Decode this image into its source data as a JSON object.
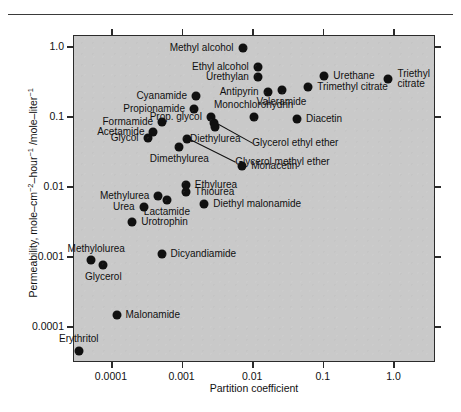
{
  "figure": {
    "x_axis_title": "Partition coefficient",
    "y_axis_title_parts": {
      "a": "Permeability, mole–cm",
      "sup1": "−2",
      "b": "–hour",
      "sup2": "−1",
      "c": " /mole–liter",
      "sup3": "−1"
    },
    "y_axis_title_plain": "Permeability, mole–cm⁻²–hour⁻¹ /mole–liter⁻¹",
    "plot_bg": "#c9c9c9",
    "frame_color": "#2b2b2b",
    "marker_color": "#101010"
  },
  "chart_data": {
    "type": "scatter",
    "title": "",
    "xlabel": "Partition coefficient",
    "ylabel": "Permeability, mole–cm⁻²–hour⁻¹ /mole–liter⁻¹",
    "xscale": "log",
    "yscale": "log",
    "xlim": [
      3e-05,
      4.0
    ],
    "ylim": [
      3e-05,
      1.4
    ],
    "xticks": [
      0.0001,
      0.001,
      0.01,
      0.1,
      1.0
    ],
    "xticklabels": [
      "0.0001",
      "0.001",
      "0.01",
      "0.1",
      "1.0"
    ],
    "yticks": [
      0.0001,
      0.001,
      0.01,
      0.1,
      1.0
    ],
    "yticklabels": [
      "0.0001",
      "0.001",
      "0.01",
      "0.1",
      "1.0"
    ],
    "grid": false,
    "legend": "none",
    "points": [
      {
        "label": "Methyl alcohol",
        "x": 0.0073,
        "y": 0.95,
        "lab_side": "r"
      },
      {
        "label": "Ethyl alcohol",
        "x": 0.012,
        "y": 0.5,
        "lab_side": "r"
      },
      {
        "label": "Urethylan",
        "x": 0.012,
        "y": 0.36,
        "lab_side": "r"
      },
      {
        "label": "Urethane",
        "x": 0.105,
        "y": 0.38,
        "lab_side": "l"
      },
      {
        "label": "Triethyl citrate",
        "x": 0.85,
        "y": 0.345,
        "lab_side": "l2"
      },
      {
        "label": "Antipyrin",
        "x": 0.0165,
        "y": 0.225,
        "lab_side": "r"
      },
      {
        "label": "Trimethyl citrate",
        "x": 0.062,
        "y": 0.265,
        "lab_side": "l"
      },
      {
        "label": "Valeramide",
        "x": 0.026,
        "y": 0.235,
        "lab_side": "c_below"
      },
      {
        "label": "Cyanamide",
        "x": 0.0016,
        "y": 0.195,
        "lab_side": "r"
      },
      {
        "label": "Propionamide",
        "x": 0.0015,
        "y": 0.125,
        "lab_side": "r"
      },
      {
        "label": "Monochlorohydrin",
        "x": 0.0105,
        "y": 0.097,
        "lab_side": "c_above"
      },
      {
        "label": "Diacetin",
        "x": 0.043,
        "y": 0.092,
        "lab_side": "l"
      },
      {
        "label": "Formamide",
        "x": 0.00053,
        "y": 0.083,
        "lab_side": "r"
      },
      {
        "label": "Acetamide",
        "x": 0.0004,
        "y": 0.06,
        "lab_side": "r"
      },
      {
        "label": "Glycol",
        "x": 0.00033,
        "y": 0.049,
        "lab_side": "r"
      },
      {
        "label": "Prop. glycol",
        "x": 0.0026,
        "y": 0.097,
        "lab_side": "r"
      },
      {
        "label": "Glycerol ethyl ether",
        "x": 0.0029,
        "y": 0.081,
        "lab_side": "leader"
      },
      {
        "label": "Diethylurea",
        "x": 0.003,
        "y": 0.07,
        "lab_side": "c_below"
      },
      {
        "label": "Glycerol methyl ether",
        "x": 0.0012,
        "y": 0.047,
        "lab_side": "leader2"
      },
      {
        "label": "Dimethylurea",
        "x": 0.00093,
        "y": 0.036,
        "lab_side": "c_below"
      },
      {
        "label": "Monacetin",
        "x": 0.0072,
        "y": 0.0195,
        "lab_side": "l"
      },
      {
        "label": "Ethylurea",
        "x": 0.00115,
        "y": 0.0105,
        "lab_side": "l"
      },
      {
        "label": "Thiourea",
        "x": 0.00115,
        "y": 0.0082,
        "lab_side": "l"
      },
      {
        "label": "Methylurea",
        "x": 0.00047,
        "y": 0.0072,
        "lab_side": "r"
      },
      {
        "label": "Lactamide",
        "x": 0.00062,
        "y": 0.0063,
        "lab_side": "c_below"
      },
      {
        "label": "Diethyl malonamide",
        "x": 0.0021,
        "y": 0.0055,
        "lab_side": "l"
      },
      {
        "label": "Urea",
        "x": 0.00029,
        "y": 0.0051,
        "lab_side": "r"
      },
      {
        "label": "Urotrophin",
        "x": 0.0002,
        "y": 0.0031,
        "lab_side": "l"
      },
      {
        "label": "Dicyandiamide",
        "x": 0.00052,
        "y": 0.00108,
        "lab_side": "l"
      },
      {
        "label": "Methylolurea",
        "x": 5.2e-05,
        "y": 0.00088,
        "lab_side": "r_above"
      },
      {
        "label": "Glycerol",
        "x": 7.8e-05,
        "y": 0.00076,
        "lab_side": "c_below"
      },
      {
        "label": "Malonamide",
        "x": 0.00012,
        "y": 0.000145,
        "lab_side": "l"
      },
      {
        "label": "Erythritol",
        "x": 3.5e-05,
        "y": 4.4e-05,
        "lab_side": "c_above"
      }
    ]
  }
}
